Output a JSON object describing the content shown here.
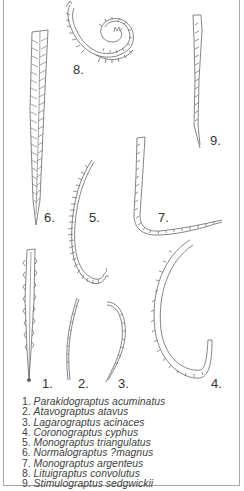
{
  "figure": {
    "type": "palaeontology-plate",
    "border_color": "#a8a8a8",
    "line_color": "#555555"
  },
  "specimens": [
    {
      "number": "1.",
      "name": "Parakidograptus acuminatus"
    },
    {
      "number": "2.",
      "name": "Atavograptus atavus"
    },
    {
      "number": "3.",
      "name": "Lagarograptus acinaces"
    },
    {
      "number": "4.",
      "name": "Coronograptus cyphus"
    },
    {
      "number": "5.",
      "name": "Monograptus triangulatus"
    },
    {
      "number": "6.",
      "name": "Normalograptus ?magnus"
    },
    {
      "number": "7.",
      "name": "Monograptus argenteus"
    },
    {
      "number": "8.",
      "name": "Lituigraptus convolutus"
    },
    {
      "number": "9.",
      "name": "Stimulograptus sedgwickii"
    }
  ],
  "legend": [
    {
      "num": "1.",
      "name": "Parakidograptus acuminatus"
    },
    {
      "num": "2.",
      "name": "Atavograptus atavus"
    },
    {
      "num": "3.",
      "name": "Lagarograptus acinaces"
    },
    {
      "num": "4.",
      "name": "Coronograptus cyphus"
    },
    {
      "num": "5.",
      "name": "Monograptus triangulatus"
    },
    {
      "num": "6.",
      "name": "Normalograptus ?magnus"
    },
    {
      "num": "7.",
      "name": "Monograptus argenteus"
    },
    {
      "num": "8.",
      "name": "Lituigraptus convolutus"
    },
    {
      "num": "9.",
      "name": "Stimulograptus sedgwickii"
    }
  ]
}
